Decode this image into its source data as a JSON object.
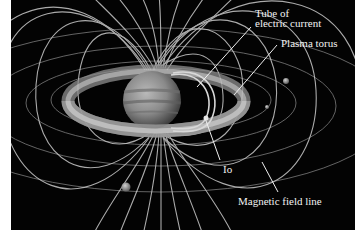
{
  "figure": {
    "background_color": "#030303",
    "line_color": "#cfcfcf",
    "labels": {
      "tube_of_current": [
        "Tube of",
        "electric current"
      ],
      "plasma_torus": "Plasma torus",
      "io": "Io",
      "magnetic_field_line": "Magnetic field line"
    }
  }
}
